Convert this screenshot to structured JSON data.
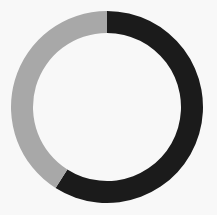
{
  "chart_data": {
    "type": "pie",
    "variant": "donut",
    "title": "",
    "categories": [
      "Segment A",
      "Segment B"
    ],
    "values": [
      59,
      41
    ],
    "colors": [
      "#1b1b1b",
      "#a8a8a8"
    ],
    "start_angle_deg": 0,
    "direction": "clockwise",
    "legend": "none",
    "labels_shown": false
  },
  "layout": {
    "cx": 107,
    "cy": 107,
    "outer_radius": 96,
    "inner_radius": 74,
    "background": "#f8f8f8"
  }
}
